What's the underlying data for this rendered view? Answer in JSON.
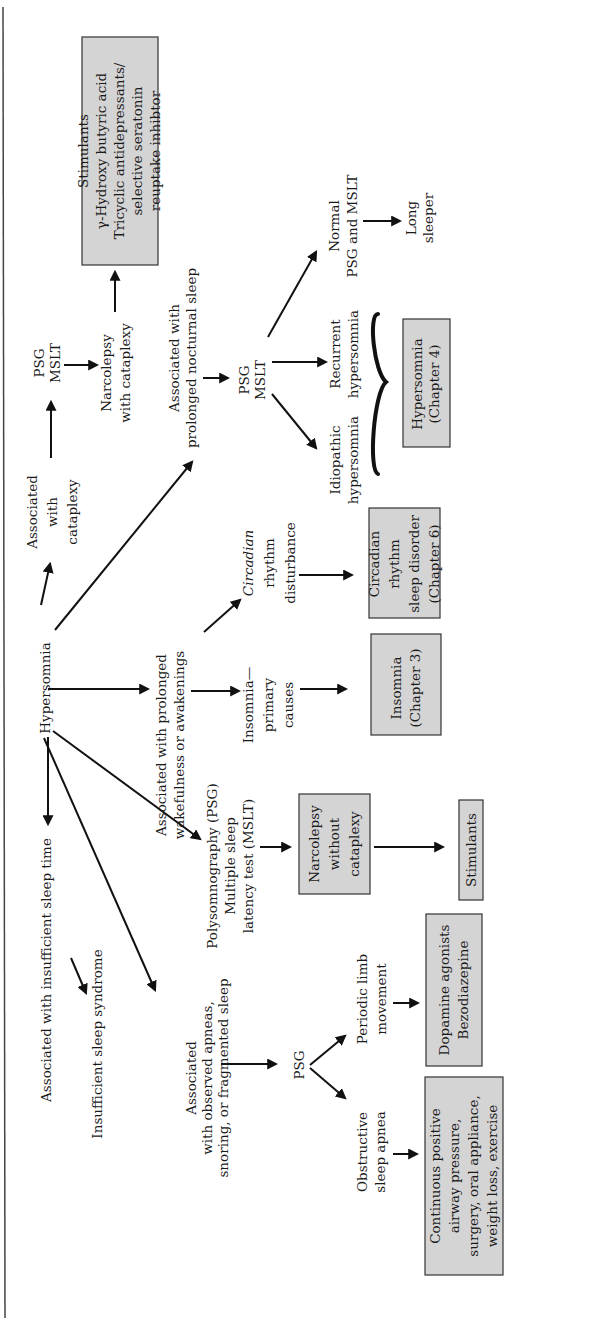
{
  "diagram": {
    "orientation": "rotated-90-ccw",
    "colors": {
      "box_fill": "#d4d4d4",
      "box_stroke": "#333333",
      "arrow": "#111111",
      "text": "#1a1a1a"
    },
    "nodes": {
      "root": {
        "lines": [
          "Hypersomnia"
        ]
      },
      "insufficient": {
        "lines": [
          "Associated with insufficient sleep time"
        ]
      },
      "insufficient_syndrome": {
        "lines": [
          "Insufficient sleep syndrome"
        ]
      },
      "apneas": {
        "lines": [
          "Associated",
          "with observed apneas,",
          "snoring, or fragmented sleep"
        ]
      },
      "psg_apnea": {
        "lines": [
          "PSG"
        ]
      },
      "osa": {
        "lines": [
          "Obstructive",
          "sleep apnea"
        ]
      },
      "osa_tx": {
        "lines": [
          "Continuous positive",
          "airway pressure,",
          "surgery, oral appliance,",
          "weight loss, exercise"
        ]
      },
      "plm": {
        "lines": [
          "Periodic limb",
          "movement"
        ]
      },
      "plm_tx": {
        "lines": [
          "Dopamine agonists",
          "Bezodiazepine"
        ]
      },
      "psg_mslt_test": {
        "lines": [
          "Polysomnography (PSG)",
          "Multiple sleep",
          "latency test (MSLT)"
        ]
      },
      "narco_wo": {
        "lines": [
          "Narcolepsy",
          "without",
          "cataplexy"
        ]
      },
      "narco_wo_tx": {
        "lines": [
          "Stimulants"
        ]
      },
      "wakeful": {
        "lines": [
          "Associated with prolonged",
          "wakefulness or awakenings"
        ]
      },
      "insomnia_primary": {
        "lines": [
          "Insomnia—",
          "primary",
          "causes"
        ]
      },
      "insomnia_ch": {
        "lines": [
          "Insomnia",
          "(Chapter 3)"
        ]
      },
      "circadian": {
        "lines": [
          "Circadian",
          "rhythm",
          "disturbance"
        ],
        "italic_first_line": true
      },
      "circadian_ch": {
        "lines": [
          "Circadian",
          "rhythm",
          "sleep disorder",
          "(Chapter 6)"
        ]
      },
      "nocturnal": {
        "lines": [
          "Associated with",
          "prolonged nocturnal sleep"
        ]
      },
      "psg_mslt_noct": {
        "lines": [
          "PSG",
          "MSLT"
        ]
      },
      "idiopathic": {
        "lines": [
          "Idiopathic",
          "hypersomnia"
        ]
      },
      "recurrent": {
        "lines": [
          "Recurrent",
          "hypersomnia"
        ]
      },
      "hyper_ch": {
        "lines": [
          "Hypersomnia",
          "(Chapter 4)"
        ]
      },
      "normal": {
        "lines": [
          "Normal",
          "PSG and MSLT"
        ]
      },
      "long_sleeper": {
        "lines": [
          "Long",
          "sleeper"
        ]
      },
      "cataplexy": {
        "lines": [
          "Associated",
          "with",
          "cataplexy"
        ]
      },
      "psg_mslt_cat": {
        "lines": [
          "PSG",
          "MSLT"
        ]
      },
      "narco_w": {
        "lines": [
          "Narcolepsy",
          "with cataplexy"
        ]
      },
      "narco_w_tx": {
        "lines": [
          "Stimulants",
          "γ-Hydroxy butyric acid",
          "Tricyclic antidepressants/",
          "selective seratonin",
          "reuptake inhibtor"
        ]
      }
    }
  }
}
